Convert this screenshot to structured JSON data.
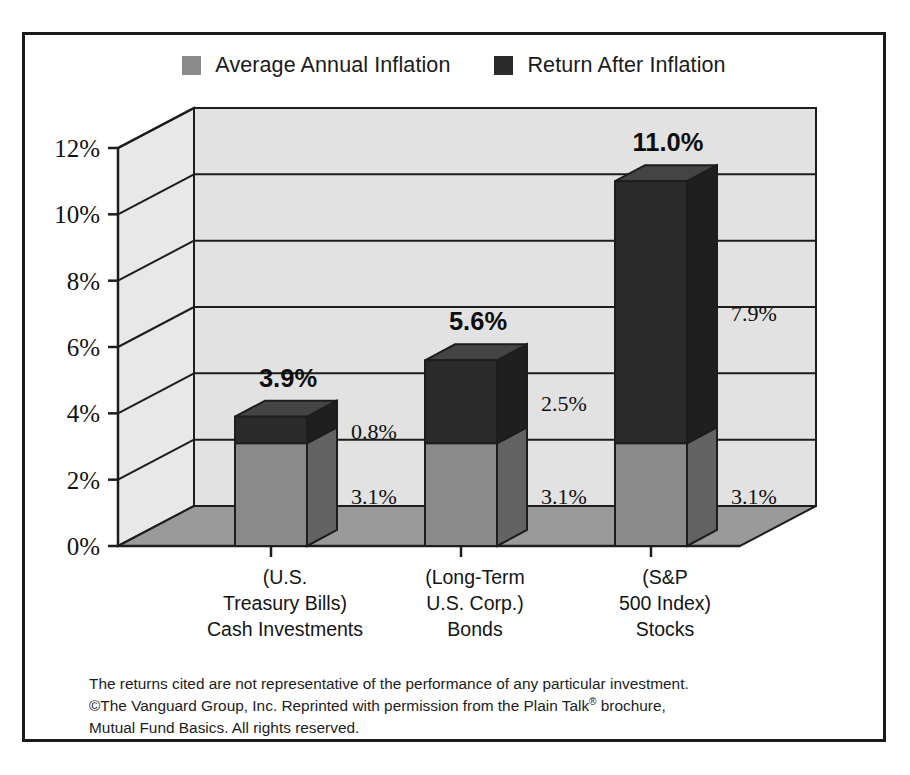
{
  "legend": {
    "entries": [
      {
        "label": "Average Annual Inflation",
        "color": "#8a8a8a",
        "icon": "legend-swatch-icon"
      },
      {
        "label": "Return After Inflation",
        "color": "#2b2b2b",
        "icon": "legend-swatch-icon"
      }
    ]
  },
  "footnote": {
    "line1": "The returns cited are not representative of the performance of any particular investment.",
    "line2a": "©The Vanguard Group, Inc. Reprinted with permission from the Plain Talk",
    "line2sup": "®",
    "line2b": " brochure,",
    "line3": "Mutual Fund Basics. All rights reserved."
  },
  "chart_data": {
    "type": "bar",
    "stacked": true,
    "three_d": true,
    "title": "",
    "xlabel": "",
    "ylabel": "",
    "ylim": [
      0,
      12
    ],
    "grid": true,
    "legend_position": "top",
    "ytick_labels": [
      "0%",
      "2%",
      "4%",
      "6%",
      "8%",
      "10%",
      "12%"
    ],
    "ytick_values": [
      0,
      2,
      4,
      6,
      8,
      10,
      12
    ],
    "categories": [
      "Cash Investments",
      "Bonds",
      "Stocks"
    ],
    "category_lines": [
      [
        "(U.S.",
        "Treasury Bills)",
        "Cash Investments"
      ],
      [
        "(Long-Term",
        "U.S. Corp.)",
        "Bonds"
      ],
      [
        "(S&P",
        "500 Index)",
        "Stocks"
      ]
    ],
    "series": [
      {
        "name": "Average Annual Inflation",
        "color": "#8a8a8a",
        "values": [
          3.1,
          3.1,
          3.1
        ],
        "labels": [
          "3.1%",
          "3.1%",
          "3.1%"
        ]
      },
      {
        "name": "Return After Inflation",
        "color": "#2b2b2b",
        "values": [
          0.8,
          2.5,
          7.9
        ],
        "labels": [
          "0.8%",
          "2.5%",
          "7.9%"
        ]
      }
    ],
    "totals": [
      3.9,
      5.6,
      11.0
    ],
    "total_labels": [
      "3.9%",
      "5.6%",
      "11.0%"
    ]
  }
}
